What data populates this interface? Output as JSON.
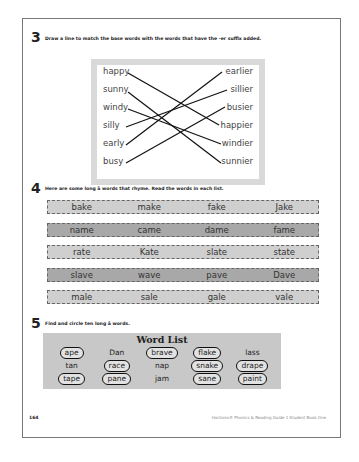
{
  "section3": {
    "number": "3",
    "instruction": "Draw a line to match the base words with the words that have the -er suffix added.",
    "left_words": [
      "happy",
      "sunny",
      "windy",
      "silly",
      "early",
      "busy"
    ],
    "right_words": [
      "earlier",
      "sillier",
      "busier",
      "happier",
      "windier",
      "sunnier"
    ],
    "matches": [
      {
        "from": "happy",
        "to": "happier"
      },
      {
        "from": "sunny",
        "to": "sunnier"
      },
      {
        "from": "windy",
        "to": "windier"
      },
      {
        "from": "silly",
        "to": "sillier"
      },
      {
        "from": "early",
        "to": "earlier"
      },
      {
        "from": "busy",
        "to": "busier"
      }
    ]
  },
  "section4": {
    "number": "4",
    "instruction": "Here are some long ā words that rhyme.  Read the words in each list.",
    "rows": [
      {
        "shade": "light",
        "words": [
          "bake",
          "make",
          "fake",
          "Jake"
        ]
      },
      {
        "shade": "dark",
        "words": [
          "name",
          "came",
          "dame",
          "fame"
        ]
      },
      {
        "shade": "light",
        "words": [
          "rate",
          "Kate",
          "slate",
          "state"
        ]
      },
      {
        "shade": "dark",
        "words": [
          "slave",
          "wave",
          "pave",
          "Dave"
        ]
      },
      {
        "shade": "light",
        "words": [
          "male",
          "sale",
          "gale",
          "vale"
        ]
      }
    ]
  },
  "section5": {
    "number": "5",
    "instruction": "Find and circle ten long ā words.",
    "word_list_title": "Word List",
    "words": [
      {
        "text": "ape",
        "circled": true
      },
      {
        "text": "Dan",
        "circled": false
      },
      {
        "text": "brave",
        "circled": true
      },
      {
        "text": "flake",
        "circled": true
      },
      {
        "text": "lass",
        "circled": false
      },
      {
        "text": "tan",
        "circled": false
      },
      {
        "text": "race",
        "circled": true
      },
      {
        "text": "nap",
        "circled": false
      },
      {
        "text": "snake",
        "circled": true
      },
      {
        "text": "drape",
        "circled": true
      },
      {
        "text": "tape",
        "circled": true
      },
      {
        "text": "pane",
        "circled": true
      },
      {
        "text": "jam",
        "circled": false
      },
      {
        "text": "sane",
        "circled": true
      },
      {
        "text": "paint",
        "circled": true
      }
    ]
  },
  "footer": {
    "page_number": "164",
    "book_title": "Horizons® Phonics & Reading Guide 1 Student Book One"
  }
}
